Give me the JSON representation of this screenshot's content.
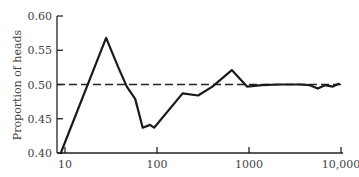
{
  "chart_data": {
    "type": "line",
    "title": "",
    "xlabel": "",
    "ylabel": "Proportion of heads",
    "xscale": "log",
    "xlim": [
      9,
      10000
    ],
    "ylim": [
      0.4,
      0.6
    ],
    "grid": false,
    "legend": null,
    "x_ticks": [
      {
        "value": 10,
        "label": "10"
      },
      {
        "value": 100,
        "label": "100"
      },
      {
        "value": 1000,
        "label": "1000"
      },
      {
        "value": 10000,
        "label": "10,000"
      }
    ],
    "y_ticks": [
      {
        "value": 0.4,
        "label": "0.40"
      },
      {
        "value": 0.45,
        "label": "0.45"
      },
      {
        "value": 0.5,
        "label": "0.50"
      },
      {
        "value": 0.55,
        "label": "0.55"
      },
      {
        "value": 0.6,
        "label": "0.60"
      }
    ],
    "series": [
      {
        "name": "Proportion of heads",
        "style": "solid",
        "x": [
          9,
          28,
          38,
          47,
          58,
          70,
          84,
          93,
          190,
          280,
          400,
          650,
          950,
          1380,
          2160,
          3560,
          4580,
          5600,
          6670,
          8140,
          9470
        ],
        "y": [
          0.4,
          0.568,
          0.525,
          0.497,
          0.479,
          0.437,
          0.441,
          0.437,
          0.487,
          0.484,
          0.497,
          0.521,
          0.497,
          0.499,
          0.5,
          0.5,
          0.499,
          0.494,
          0.499,
          0.497,
          0.501
        ]
      }
    ],
    "reference_lines": [
      {
        "axis": "y",
        "value": 0.5,
        "style": "dashed",
        "label": ""
      }
    ]
  }
}
